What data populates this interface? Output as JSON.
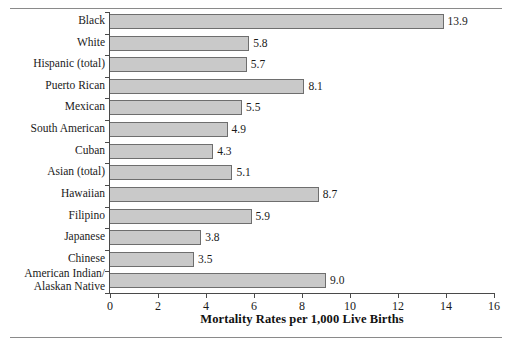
{
  "chart_data": {
    "type": "bar",
    "orientation": "horizontal",
    "title": "",
    "xlabel": "Mortality Rates per 1,000 Live Births",
    "ylabel": "",
    "xlim": [
      0,
      16
    ],
    "xticks": [
      0,
      2,
      4,
      6,
      8,
      10,
      12,
      14,
      16
    ],
    "grid": false,
    "legend": false,
    "categories": [
      "Black",
      "White",
      "Hispanic (total)",
      "Puerto Rican",
      "Mexican",
      "South American",
      "Cuban",
      "Asian (total)",
      "Hawaiian",
      "Filipino",
      "Japanese",
      "Chinese",
      "American Indian/ Alaskan Native"
    ],
    "category_lines": [
      [
        "Black"
      ],
      [
        "White"
      ],
      [
        "Hispanic (total)"
      ],
      [
        "Puerto Rican"
      ],
      [
        "Mexican"
      ],
      [
        "South American"
      ],
      [
        "Cuban"
      ],
      [
        "Asian (total)"
      ],
      [
        "Hawaiian"
      ],
      [
        "Filipino"
      ],
      [
        "Japanese"
      ],
      [
        "Chinese"
      ],
      [
        "American Indian/",
        "Alaskan Native"
      ]
    ],
    "values": [
      13.9,
      5.8,
      5.7,
      8.1,
      5.5,
      4.9,
      4.3,
      5.1,
      8.7,
      5.9,
      3.8,
      3.5,
      9.0
    ],
    "value_labels": [
      "13.9",
      "5.8",
      "5.7",
      "8.1",
      "5.5",
      "4.9",
      "4.3",
      "5.1",
      "8.7",
      "5.9",
      "3.8",
      "3.5",
      "9.0"
    ],
    "bar_fill_color": "#c9c9c9",
    "bar_edge_color": "#6e6e6e",
    "axis_color": "#4a4a4a",
    "text_color": "#1a1a1a",
    "background_color": "#ffffff"
  }
}
